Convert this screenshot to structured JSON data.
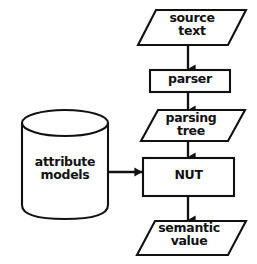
{
  "diagram": {
    "type": "flowchart",
    "canvas": {
      "width": 257,
      "height": 264,
      "background": "#ffffff"
    },
    "stroke_color": "#111111",
    "text_color": "#111111",
    "nodes": [
      {
        "id": "source-text",
        "label": "source\ntext",
        "shape": "parallelogram",
        "role": "data"
      },
      {
        "id": "parser",
        "label": "parser",
        "shape": "rectangle",
        "role": "process"
      },
      {
        "id": "parsing-tree",
        "label": "parsing\ntree",
        "shape": "parallelogram",
        "role": "data"
      },
      {
        "id": "nut",
        "label": "NUT",
        "shape": "rectangle",
        "role": "process"
      },
      {
        "id": "semantic-value",
        "label": "semantic\nvalue",
        "shape": "parallelogram",
        "role": "data"
      },
      {
        "id": "attribute-models",
        "label": "attribute\nmodels",
        "shape": "cylinder",
        "role": "datastore"
      }
    ],
    "edges": [
      {
        "id": "edge-source-to-parser",
        "from": "source-text",
        "to": "parser",
        "direction": "down"
      },
      {
        "id": "edge-parser-to-tree",
        "from": "parser",
        "to": "parsing-tree",
        "direction": "down"
      },
      {
        "id": "edge-tree-to-nut",
        "from": "parsing-tree",
        "to": "nut",
        "direction": "down"
      },
      {
        "id": "edge-models-to-nut",
        "from": "attribute-models",
        "to": "nut",
        "direction": "right"
      },
      {
        "id": "edge-nut-to-semantic",
        "from": "nut",
        "to": "semantic-value",
        "direction": "down"
      }
    ]
  }
}
